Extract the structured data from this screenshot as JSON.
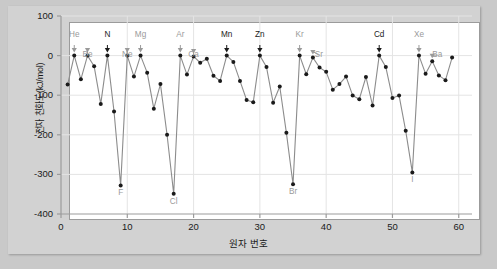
{
  "chart_data": {
    "type": "line",
    "title": "",
    "xlabel": "원자 번호",
    "ylabel": "전자 친화도(kJ/mol)",
    "xlim": [
      0,
      62
    ],
    "ylim": [
      -400,
      100
    ],
    "xticks": [
      0,
      10,
      20,
      30,
      40,
      50,
      60
    ],
    "yticks": [
      100,
      0,
      -100,
      -200,
      -300,
      -400
    ],
    "xtick_labels": [
      "0",
      "10",
      "20",
      "30",
      "40",
      "50",
      "60"
    ],
    "ytick_labels": [
      "100",
      "0",
      "-100",
      "-200",
      "-300",
      "-400"
    ],
    "grid": true,
    "legend": "none",
    "marker": "filled-circle",
    "line_color": "#8c8c8c",
    "marker_color": "#1a1a1a",
    "grid_color": "#e4e4e4",
    "axis_color": "#9b9b9b",
    "series": [
      {
        "name": "전자 친화도",
        "x": [
          1,
          2,
          3,
          4,
          5,
          6,
          7,
          8,
          9,
          10,
          11,
          12,
          13,
          14,
          15,
          16,
          17,
          18,
          19,
          20,
          21,
          22,
          23,
          24,
          25,
          26,
          27,
          28,
          29,
          30,
          31,
          32,
          33,
          34,
          35,
          36,
          37,
          38,
          39,
          40,
          41,
          42,
          43,
          44,
          45,
          46,
          47,
          48,
          49,
          50,
          51,
          52,
          53,
          54,
          55,
          56,
          57,
          58,
          59
        ],
        "values": [
          -73,
          0,
          -60,
          0,
          -27,
          -122,
          0,
          -141,
          -328,
          0,
          -53,
          0,
          -43,
          -134,
          -72,
          -200,
          -349,
          0,
          -48,
          -2,
          -18,
          -8,
          -51,
          -64,
          0,
          -16,
          -64,
          -112,
          -118,
          0,
          -29,
          -119,
          -78,
          -195,
          -325,
          0,
          -47,
          -5,
          -30,
          -41,
          -86,
          -72,
          -53,
          -101,
          -110,
          -54,
          -126,
          0,
          -29,
          -107,
          -101,
          -190,
          -295,
          0,
          -46,
          -14,
          -50,
          -62,
          -5
        ]
      }
    ],
    "annotations": [
      {
        "label": "He",
        "atomic_number": 2,
        "value": 0,
        "style": "gray",
        "arrow": "straight",
        "label_dx": 0,
        "label_dy": 0
      },
      {
        "label": "Be",
        "atomic_number": 4,
        "value": 0,
        "style": "gray",
        "arrow": "straight",
        "label_dx": 0,
        "label_dy": 10
      },
      {
        "label": "N",
        "atomic_number": 7,
        "value": 0,
        "style": "dark",
        "arrow": "straight",
        "label_dx": 0,
        "label_dy": 0
      },
      {
        "label": "Ne",
        "atomic_number": 10,
        "value": 0,
        "style": "gray",
        "arrow": "straight",
        "label_dx": 0,
        "label_dy": 10
      },
      {
        "label": "Mg",
        "atomic_number": 12,
        "value": 0,
        "style": "gray",
        "arrow": "straight",
        "label_dx": 0,
        "label_dy": 0
      },
      {
        "label": "Ar",
        "atomic_number": 18,
        "value": 0,
        "style": "gray",
        "arrow": "straight",
        "label_dx": 0,
        "label_dy": 0
      },
      {
        "label": "Ca",
        "atomic_number": 20,
        "value": -2,
        "style": "gray",
        "arrow": "straight",
        "label_dx": 0,
        "label_dy": 10
      },
      {
        "label": "Mn",
        "atomic_number": 25,
        "value": 0,
        "style": "dark",
        "arrow": "straight",
        "label_dx": 0,
        "label_dy": 0
      },
      {
        "label": "Zn",
        "atomic_number": 30,
        "value": 0,
        "style": "dark",
        "arrow": "straight",
        "label_dx": 0,
        "label_dy": 0
      },
      {
        "label": "Kr",
        "atomic_number": 36,
        "value": 0,
        "style": "gray",
        "arrow": "straight",
        "label_dx": 0,
        "label_dy": 0
      },
      {
        "label": "Sr",
        "atomic_number": 38,
        "value": -5,
        "style": "gray",
        "arrow": "slanted",
        "label_dx": 6,
        "label_dy": 10
      },
      {
        "label": "Cd",
        "atomic_number": 48,
        "value": 0,
        "style": "dark",
        "arrow": "straight",
        "label_dx": 0,
        "label_dy": 0
      },
      {
        "label": "Xe",
        "atomic_number": 54,
        "value": 0,
        "style": "gray",
        "arrow": "straight",
        "label_dx": 0,
        "label_dy": 0
      },
      {
        "label": "Ba",
        "atomic_number": 56,
        "value": -14,
        "style": "gray",
        "arrow": "slanted",
        "label_dx": 5,
        "label_dy": 10
      }
    ],
    "bottom_labels": [
      {
        "label": "F",
        "atomic_number": 9,
        "value": -328
      },
      {
        "label": "Cl",
        "atomic_number": 17,
        "value": -349
      },
      {
        "label": "Br",
        "atomic_number": 35,
        "value": -325
      },
      {
        "label": "I",
        "atomic_number": 53,
        "value": -295
      }
    ]
  }
}
